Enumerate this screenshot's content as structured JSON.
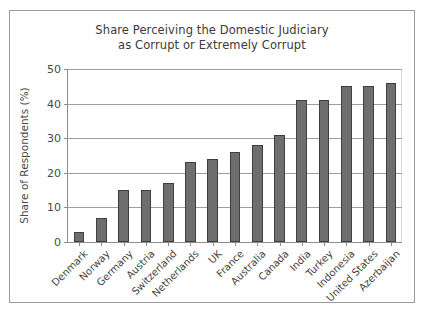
{
  "chart_data": {
    "type": "bar",
    "title": "Share Perceiving the Domestic Judiciary as Corrupt or Extremely Corrupt",
    "title_lines": [
      "Share Perceiving the Domestic Judiciary",
      "as Corrupt or Extremely Corrupt"
    ],
    "xlabel": "",
    "ylabel": "Share of Respondents (%)",
    "categories": [
      "Denmark",
      "Norway",
      "Germany",
      "Austria",
      "Switzerland",
      "Netherlands",
      "UK",
      "France",
      "Australia",
      "Canada",
      "India",
      "Turkey",
      "Indonesia",
      "United States",
      "Azerbaijan"
    ],
    "values": [
      3,
      7,
      15,
      15,
      17,
      23,
      24,
      26,
      28,
      31,
      41,
      41,
      45,
      45,
      46
    ],
    "ylim": [
      0,
      50
    ],
    "yticks": [
      0,
      10,
      20,
      30,
      40,
      50
    ],
    "ytick_labels": [
      "0",
      "10",
      "20",
      "30",
      "40",
      "50"
    ],
    "grid": true,
    "grid_axis": "y",
    "legend": false,
    "bar_color": "#6e6e6e",
    "bar_edge_color": "#3f3f3f",
    "background_color": "#ffffff",
    "frame_color": "#9a9a9a"
  }
}
